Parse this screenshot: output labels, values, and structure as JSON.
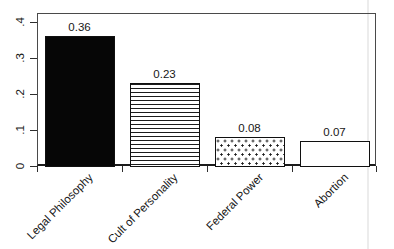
{
  "chart_data": {
    "type": "bar",
    "title": "",
    "xlabel": "",
    "ylabel": "",
    "categories": [
      "Legal Philosophy",
      "Cult of Personality",
      "Federal Power",
      "Abortion"
    ],
    "values": [
      0.36,
      0.23,
      0.08,
      0.07
    ],
    "value_labels": [
      "0.36",
      "0.23",
      "0.08",
      "0.07"
    ],
    "bar_fills": [
      "solid",
      "hlines",
      "dots",
      "plain"
    ],
    "y_tick_labels": [
      "0",
      ".1",
      ".2",
      ".3",
      ".4"
    ],
    "y_tick_values": [
      0,
      0.1,
      0.2,
      0.3,
      0.4
    ],
    "ylim": [
      0,
      0.4
    ],
    "grid": false,
    "legend": false,
    "colors": {
      "bar_ink": "#060606",
      "frame": "#4a4a4a",
      "axis": "#1c1c1c",
      "text": "#161616",
      "background": "#ffffff",
      "scan_artifact": "#ececec"
    }
  }
}
